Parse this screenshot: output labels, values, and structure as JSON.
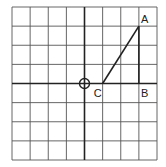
{
  "diagram": {
    "grid": {
      "cols": 8,
      "rows": 8,
      "x0": 12,
      "y0": 7,
      "x1": 157,
      "y1": 160
    },
    "axes": {
      "origin_col": 4,
      "origin_row": 4
    },
    "points": [
      {
        "label": "A",
        "col": 7,
        "row": 1
      },
      {
        "label": "B",
        "col": 7,
        "row": 4
      },
      {
        "label": "C",
        "col": 5,
        "row": 4
      }
    ],
    "origin_marker": "circle-with-cross",
    "colors": {
      "line": "#222222",
      "grid": "#444444",
      "background": "#ffffff"
    }
  }
}
